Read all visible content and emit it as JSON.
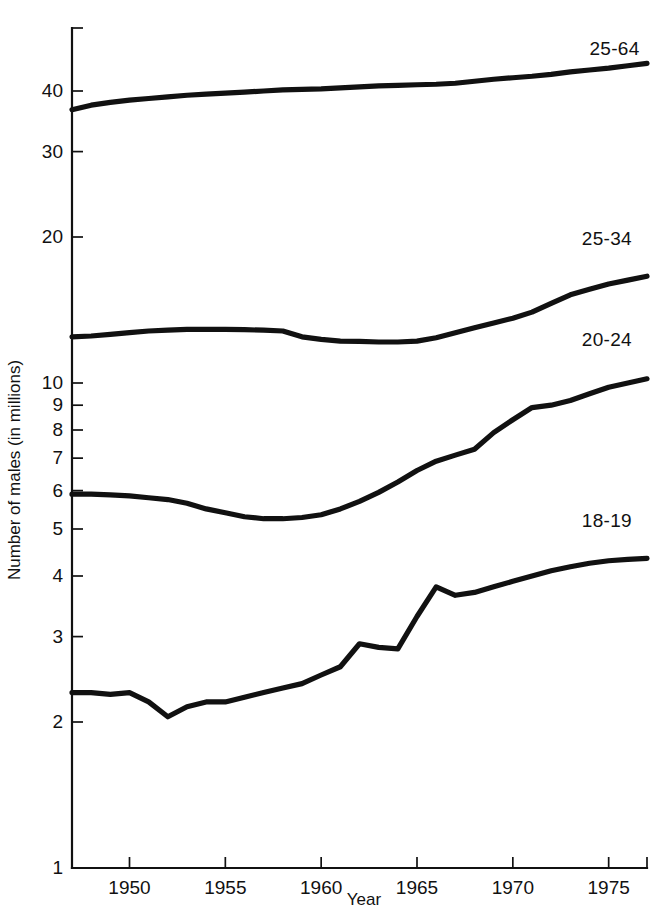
{
  "chart_data": {
    "type": "line",
    "title": "",
    "xlabel": "Year",
    "ylabel": "Number of males (in millions)",
    "yscale": "log",
    "ylim": [
      1,
      48
    ],
    "xlim": [
      1947,
      1977
    ],
    "grid": false,
    "legend_position": "inline-right-end-of-line",
    "y_ticks": [
      1,
      2,
      3,
      4,
      5,
      6,
      7,
      8,
      9,
      10,
      20,
      30,
      40
    ],
    "y_tick_labels": [
      "1",
      "2",
      "3",
      "4",
      "5",
      "6",
      "7",
      "8",
      "9",
      "10",
      "20",
      "30",
      "40"
    ],
    "x_ticks": [
      1950,
      1955,
      1960,
      1965,
      1970,
      1975
    ],
    "x_tick_labels": [
      "1950",
      "1955",
      "1960",
      "1965",
      "1970",
      "1975"
    ],
    "x": [
      1947,
      1948,
      1949,
      1950,
      1951,
      1952,
      1953,
      1954,
      1955,
      1956,
      1957,
      1958,
      1959,
      1960,
      1961,
      1962,
      1963,
      1964,
      1965,
      1966,
      1967,
      1968,
      1969,
      1970,
      1971,
      1972,
      1973,
      1974,
      1975,
      1976,
      1977
    ],
    "series": [
      {
        "name": "25-64",
        "label": "25-64",
        "color": "#111111",
        "values": [
          36.6,
          37.4,
          37.9,
          38.3,
          38.6,
          38.9,
          39.2,
          39.4,
          39.6,
          39.8,
          40.0,
          40.2,
          40.3,
          40.4,
          40.6,
          40.8,
          41.0,
          41.1,
          41.2,
          41.3,
          41.5,
          41.9,
          42.3,
          42.6,
          42.9,
          43.3,
          43.8,
          44.2,
          44.6,
          45.1,
          45.6
        ]
      },
      {
        "name": "25-34",
        "label": "25-34",
        "color": "#111111",
        "values": [
          12.45,
          12.5,
          12.6,
          12.7,
          12.8,
          12.85,
          12.9,
          12.9,
          12.9,
          12.88,
          12.85,
          12.8,
          12.45,
          12.3,
          12.2,
          12.18,
          12.15,
          12.15,
          12.2,
          12.4,
          12.7,
          13.0,
          13.3,
          13.6,
          14.0,
          14.6,
          15.2,
          15.6,
          16.0,
          16.3,
          16.6
        ]
      },
      {
        "name": "20-24",
        "label": "20-24",
        "color": "#111111",
        "values": [
          5.9,
          5.9,
          5.88,
          5.85,
          5.8,
          5.75,
          5.65,
          5.5,
          5.4,
          5.3,
          5.25,
          5.25,
          5.28,
          5.35,
          5.5,
          5.7,
          5.95,
          6.25,
          6.6,
          6.9,
          7.1,
          7.3,
          7.9,
          8.4,
          8.9,
          9.0,
          9.2,
          9.5,
          9.8,
          10.0,
          10.2
        ]
      },
      {
        "name": "18-19",
        "label": "18-19",
        "color": "#111111",
        "values": [
          2.3,
          2.3,
          2.28,
          2.3,
          2.2,
          2.05,
          2.15,
          2.2,
          2.2,
          2.25,
          2.3,
          2.35,
          2.4,
          2.5,
          2.6,
          2.9,
          2.85,
          2.83,
          3.3,
          3.8,
          3.65,
          3.7,
          3.8,
          3.9,
          4.0,
          4.1,
          4.18,
          4.25,
          4.3,
          4.33,
          4.35
        ]
      }
    ],
    "series_label_positions": [
      {
        "name": "25-64",
        "x": 1974.0,
        "y_value": 47.5
      },
      {
        "name": "25-34",
        "x": 1973.6,
        "y_value": 19.3
      },
      {
        "name": "20-24",
        "x": 1973.6,
        "y_value": 11.9
      },
      {
        "name": "18-19",
        "x": 1973.6,
        "y_value": 5.05
      }
    ]
  },
  "axes": {
    "x_title": "Year",
    "y_title": "Number of males (in millions)"
  }
}
